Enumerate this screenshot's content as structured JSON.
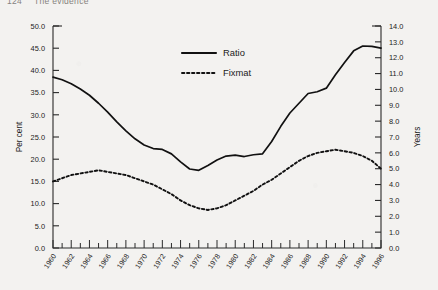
{
  "page": {
    "running_head_folio": "124",
    "running_head_title": "The evidence"
  },
  "chart_data": {
    "type": "line",
    "title": "",
    "xlabel": "",
    "ylabel": "Per cent",
    "y2label": "Years",
    "xlim": [
      1960,
      1996
    ],
    "ylim": [
      0.0,
      50.0
    ],
    "y2lim": [
      0.0,
      14.0
    ],
    "grid": false,
    "legend_position": "top-center",
    "y_ticks": [
      "0.0",
      "5.0",
      "10.0",
      "15.0",
      "20.0",
      "25.0",
      "30.0",
      "35.0",
      "40.0",
      "45.0",
      "50.0"
    ],
    "y2_ticks": [
      "0.0",
      "1.0",
      "2.0",
      "3.0",
      "4.0",
      "5.0",
      "6.0",
      "7.0",
      "8.0",
      "9.0",
      "10.0",
      "11.0",
      "12.0",
      "13.0",
      "14.0"
    ],
    "x_ticks": [
      "1960",
      "1962",
      "1964",
      "1966",
      "1968",
      "1970",
      "1972",
      "1974",
      "1976",
      "1978",
      "1980",
      "1982",
      "1984",
      "1986",
      "1988",
      "1990",
      "1992",
      "1994",
      "1996"
    ],
    "x": [
      1960,
      1961,
      1962,
      1963,
      1964,
      1965,
      1966,
      1967,
      1968,
      1969,
      1970,
      1971,
      1972,
      1973,
      1974,
      1975,
      1976,
      1977,
      1978,
      1979,
      1980,
      1981,
      1982,
      1983,
      1984,
      1985,
      1986,
      1987,
      1988,
      1989,
      1990,
      1991,
      1992,
      1993,
      1994,
      1995,
      1996
    ],
    "series": [
      {
        "name": "Ratio",
        "axis": "left",
        "style": "solid",
        "color": "#111111",
        "values": [
          38.5,
          37.9,
          37.0,
          35.8,
          34.4,
          32.6,
          30.6,
          28.4,
          26.4,
          24.6,
          23.2,
          22.4,
          22.2,
          21.2,
          19.4,
          17.8,
          17.5,
          18.6,
          19.8,
          20.7,
          20.9,
          20.6,
          21.0,
          21.2,
          24.0,
          27.4,
          30.4,
          32.6,
          34.8,
          35.2,
          36.0,
          39.0,
          41.8,
          44.4,
          45.5,
          45.4,
          45.0
        ]
      },
      {
        "name": "Fixmat",
        "axis": "right",
        "style": "dashed",
        "color": "#111111",
        "values": [
          4.2,
          4.4,
          4.6,
          4.7,
          4.8,
          4.9,
          4.8,
          4.7,
          4.6,
          4.4,
          4.2,
          4.0,
          3.7,
          3.4,
          3.0,
          2.7,
          2.5,
          2.4,
          2.5,
          2.7,
          3.0,
          3.3,
          3.6,
          4.0,
          4.3,
          4.7,
          5.1,
          5.5,
          5.8,
          6.0,
          6.1,
          6.2,
          6.1,
          6.0,
          5.8,
          5.5,
          5.0
        ]
      }
    ]
  }
}
